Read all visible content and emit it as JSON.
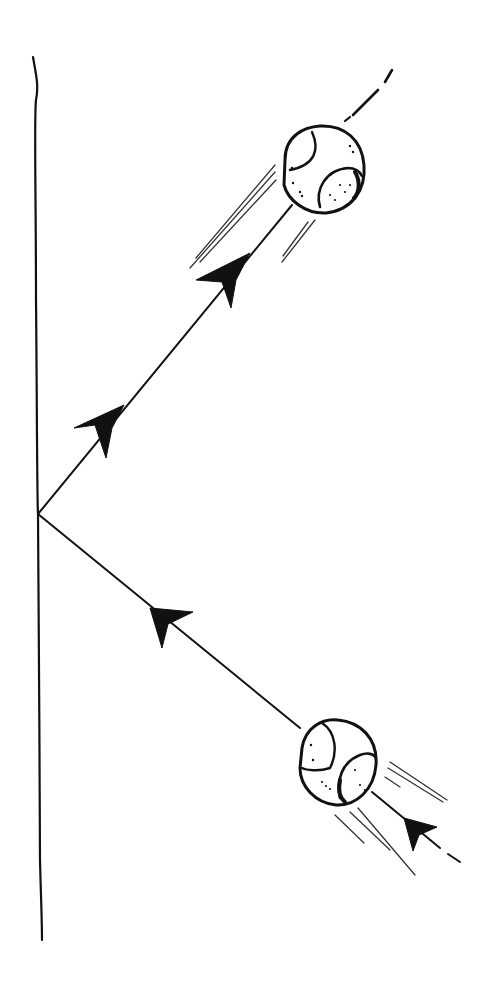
{
  "diagram": {
    "title": "",
    "colors": {
      "ink": "#111111",
      "background": "#ffffff"
    },
    "wall": {
      "x_top": 33,
      "y_top": 57,
      "x_bottom": 42,
      "y_bottom": 940
    },
    "bounce_point": {
      "x": 38,
      "y": 514
    },
    "incoming_path": {
      "from": {
        "x": 300,
        "y": 728
      },
      "to": {
        "x": 38,
        "y": 514
      },
      "arrows": 1,
      "direction": "toward-wall"
    },
    "outgoing_path": {
      "from": {
        "x": 38,
        "y": 514
      },
      "to": {
        "x": 292,
        "y": 205
      },
      "arrows": 2,
      "direction": "away-from-wall"
    },
    "balls": [
      {
        "label": "ball-incoming",
        "cx": 338,
        "cy": 764,
        "r": 40
      },
      {
        "label": "ball-outgoing",
        "cx": 322,
        "cy": 172,
        "r": 42
      }
    ],
    "icons": [
      "arrow-head-icon",
      "ball-icon",
      "motion-lines-icon",
      "wall-icon"
    ]
  }
}
